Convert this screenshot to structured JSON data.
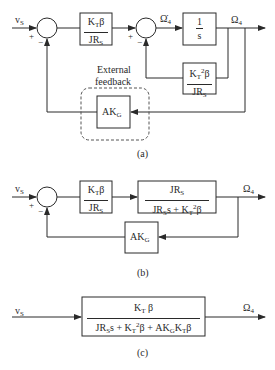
{
  "diagrams": [
    {
      "id": "a",
      "caption": "(a)",
      "input_label": "v",
      "input_sub": "S",
      "output_label": "Ω",
      "output_sub": "4",
      "intermediate_label": "Ω̇",
      "intermediate_sub": "4",
      "signs": {
        "sum1_plus": "+",
        "sum1_minus": "−",
        "sum2_plus": "+",
        "sum2_minus": "−"
      },
      "block1": {
        "num_main": "K",
        "num_sub": "T",
        "num_tail": "β",
        "den_main": "JR",
        "den_sub": "S"
      },
      "integrator": {
        "num": "1",
        "den": "s"
      },
      "inner_feedback": {
        "num_main": "K",
        "num_sub": "T",
        "num_sup": "2",
        "num_tail": "β",
        "den_main": "JR",
        "den_sub": "S"
      },
      "outer_feedback": {
        "main": "AK",
        "sub": "G"
      },
      "annotation_line1": "External",
      "annotation_line2": "feedback"
    },
    {
      "id": "b",
      "caption": "(b)",
      "input_label": "v",
      "input_sub": "S",
      "output_label": "Ω",
      "output_sub": "4",
      "signs": {
        "sum_plus": "+",
        "sum_minus": "−"
      },
      "block1": {
        "num_main": "K",
        "num_sub": "T",
        "num_tail": "β",
        "den_main": "JR",
        "den_sub": "S"
      },
      "block2": {
        "num_main": "JR",
        "num_sub": "S",
        "den_a": "JR",
        "den_a_sub": "S",
        "den_b": "s + K",
        "den_b_sub": "T",
        "den_b_sup": "2",
        "den_b_tail": "β"
      },
      "feedback": {
        "main": "AK",
        "sub": "G"
      }
    },
    {
      "id": "c",
      "caption": "(c)",
      "input_label": "v",
      "input_sub": "S",
      "output_label": "Ω",
      "output_sub": "4",
      "block": {
        "num_main": "K",
        "num_sub": "T",
        "num_tail": " β",
        "den_1": "JR",
        "den_1_sub": "S",
        "den_2": "s + K",
        "den_2_sub": "T",
        "den_2_sup": "2",
        "den_3": "β + AK",
        "den_3_sub": "G",
        "den_4": "K",
        "den_4_sub": "T",
        "den_4_tail": "β"
      }
    }
  ]
}
